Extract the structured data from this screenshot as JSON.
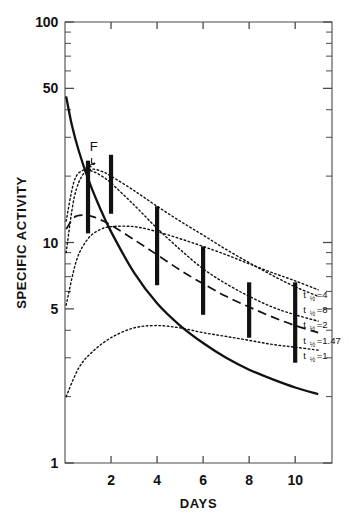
{
  "chart_data": {
    "type": "line",
    "title": "",
    "xlabel": "DAYS",
    "ylabel": "SPECIFIC ACTIVITY",
    "xscale": "linear",
    "yscale": "log",
    "xlim": [
      0,
      11.6
    ],
    "ylim": [
      1,
      100
    ],
    "grid": false,
    "legend_position": "right-inside",
    "x_ticks": [
      "2",
      "4",
      "6",
      "8",
      "10"
    ],
    "x_tick_values": [
      2,
      4,
      6,
      8,
      10
    ],
    "y_ticks": [
      "100",
      "50",
      "10",
      "5",
      "1"
    ],
    "y_tick_values": [
      100,
      50,
      10,
      5,
      1
    ],
    "y_minor_ticks": [
      90,
      80,
      70,
      60,
      40,
      30,
      20,
      9,
      8,
      7,
      6,
      4,
      3,
      2
    ],
    "series": [
      {
        "name": "F",
        "style": "solid",
        "annotation": "F",
        "x": [
          0.05,
          0.3,
          0.6,
          1.0,
          1.5,
          2.0,
          3.0,
          4.0,
          5.0,
          6.0,
          7.0,
          8.0,
          9.0,
          10.0,
          11.0
        ],
        "values": [
          46,
          34,
          26,
          19.5,
          14.5,
          11.2,
          7.3,
          5.3,
          4.2,
          3.5,
          3.0,
          2.65,
          2.4,
          2.2,
          2.05
        ]
      },
      {
        "name": "t 1/2 = 4",
        "style": "dotted",
        "label": "t ½ =4",
        "label_main": "t",
        "label_frac": "½",
        "label_eq": "=4",
        "x": [
          0.05,
          0.4,
          0.8,
          1.2,
          1.6,
          2.0,
          3.0,
          4.0,
          5.0,
          6.0,
          7.0,
          8.0,
          9.0,
          10.0,
          11.0
        ],
        "values": [
          9.0,
          16.0,
          20.5,
          21.5,
          21.0,
          20.0,
          17.2,
          14.6,
          12.5,
          10.8,
          9.3,
          8.1,
          7.1,
          6.3,
          5.7
        ]
      },
      {
        "name": "t 1/2 = 8",
        "style": "dotted",
        "label": "t ½ =8",
        "label_main": "t",
        "label_frac": "½",
        "label_eq": "=8",
        "x": [
          0.05,
          0.5,
          1.0,
          1.5,
          2.0,
          3.0,
          4.0,
          5.0,
          6.0,
          7.0,
          8.0,
          9.0,
          10.0,
          11.0
        ],
        "values": [
          5.2,
          8.3,
          10.4,
          11.4,
          11.8,
          11.8,
          11.2,
          10.4,
          9.6,
          8.8,
          8.0,
          7.3,
          6.7,
          6.1
        ]
      },
      {
        "name": "t 1/2 = 2",
        "style": "dotted",
        "label": "t ½ =2",
        "label_main": "t",
        "label_frac": "½",
        "label_eq": "=2",
        "x": [
          0.05,
          0.4,
          0.8,
          1.2,
          1.6,
          2.0,
          3.0,
          4.0,
          5.0,
          6.0,
          7.0,
          8.0,
          9.0,
          10.0,
          11.0
        ],
        "values": [
          12.5,
          19.0,
          21.3,
          21.0,
          20.0,
          18.6,
          14.8,
          11.6,
          9.3,
          7.6,
          6.5,
          5.7,
          5.1,
          4.7,
          4.4
        ]
      },
      {
        "name": "t 1/2 = 1.47",
        "style": "dashed",
        "label": "t ½ =1.47",
        "label_main": "t",
        "label_frac": "½",
        "label_eq": "=1.47",
        "x": [
          0.05,
          0.4,
          0.8,
          1.2,
          1.6,
          2.0,
          3.0,
          4.0,
          5.0,
          6.0,
          7.0,
          8.0,
          9.0,
          10.0,
          11.0
        ],
        "values": [
          11.5,
          13.0,
          13.3,
          13.1,
          12.6,
          12.0,
          10.3,
          8.8,
          7.5,
          6.5,
          5.7,
          5.1,
          4.6,
          4.2,
          3.9
        ]
      },
      {
        "name": "t 1/2 = 1",
        "style": "dotted",
        "label": "t ½ =1",
        "label_main": "t",
        "label_frac": "½",
        "label_eq": "=1",
        "x": [
          0.05,
          0.6,
          1.2,
          2.0,
          3.0,
          4.0,
          5.0,
          6.0,
          7.0,
          8.0,
          9.0,
          10.0,
          11.0
        ],
        "values": [
          2.0,
          2.7,
          3.2,
          3.7,
          4.1,
          4.2,
          4.1,
          3.9,
          3.75,
          3.6,
          3.45,
          3.35,
          3.25
        ]
      }
    ],
    "error_bars": [
      {
        "x": 1,
        "low": 11.0,
        "high": 23.5
      },
      {
        "x": 2,
        "low": 13.5,
        "high": 25.0
      },
      {
        "x": 4,
        "low": 6.4,
        "high": 14.6
      },
      {
        "x": 6,
        "low": 4.7,
        "high": 9.6
      },
      {
        "x": 8,
        "low": 3.7,
        "high": 6.6
      },
      {
        "x": 10,
        "low": 2.85,
        "high": 6.6
      }
    ],
    "annotations": [
      {
        "text": "F",
        "x": 1.25,
        "y": 26.0,
        "target_x": 0.72,
        "target_y": 21.5
      }
    ]
  },
  "colors": {
    "axis": "#4a4a4a",
    "curve": "#111111",
    "error_bar": "#111111",
    "text": "#111111",
    "background": "#ffffff"
  }
}
